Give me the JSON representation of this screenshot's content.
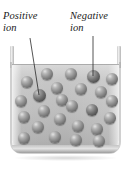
{
  "figure": {
    "background_color": "#ffffff"
  },
  "labels": [
    {
      "id": "positive",
      "text": "Positive\nion",
      "x": 3,
      "y": 10,
      "leader": {
        "x1": 30,
        "y1": 38,
        "x2": 39,
        "y2": 95
      }
    },
    {
      "id": "negative",
      "text": "Negative\nion",
      "x": 70,
      "y": 10,
      "leader": {
        "x1": 93,
        "y1": 36,
        "x2": 93,
        "y2": 76
      }
    }
  ],
  "container": {
    "name": "glass-beaker",
    "glass_color": "#c9c9c9",
    "liquid_color_top": "#d8d8d8",
    "liquid_color_bottom": "#a8a8a8",
    "rim_line_color": "#9a9a9a"
  },
  "ions": {
    "sphere_color_light": "#8e8e8e",
    "sphere_color_dark": "#717171",
    "count": 25,
    "items": [
      {
        "cx": 27,
        "cy": 82,
        "r": 6.0,
        "shade": "light"
      },
      {
        "cx": 47,
        "cy": 74,
        "r": 6.2,
        "shade": "light"
      },
      {
        "cx": 71,
        "cy": 74,
        "r": 6.2,
        "shade": "light"
      },
      {
        "cx": 93,
        "cy": 76,
        "r": 6.5,
        "shade": "dark"
      },
      {
        "cx": 112,
        "cy": 79,
        "r": 6.0,
        "shade": "light"
      },
      {
        "cx": 39,
        "cy": 95,
        "r": 6.5,
        "shade": "dark"
      },
      {
        "cx": 57,
        "cy": 88,
        "r": 5.8,
        "shade": "light"
      },
      {
        "cx": 81,
        "cy": 89,
        "r": 6.2,
        "shade": "light"
      },
      {
        "cx": 101,
        "cy": 92,
        "r": 6.0,
        "shade": "light"
      },
      {
        "cx": 21,
        "cy": 101,
        "r": 6.0,
        "shade": "light"
      },
      {
        "cx": 62,
        "cy": 100,
        "r": 6.0,
        "shade": "light"
      },
      {
        "cx": 112,
        "cy": 101,
        "r": 5.8,
        "shade": "light"
      },
      {
        "cx": 44,
        "cy": 111,
        "r": 6.2,
        "shade": "light"
      },
      {
        "cx": 72,
        "cy": 106,
        "r": 6.0,
        "shade": "light"
      },
      {
        "cx": 92,
        "cy": 110,
        "r": 6.2,
        "shade": "dark"
      },
      {
        "cx": 24,
        "cy": 117,
        "r": 6.0,
        "shade": "light"
      },
      {
        "cx": 60,
        "cy": 119,
        "r": 6.0,
        "shade": "light"
      },
      {
        "cx": 110,
        "cy": 118,
        "r": 5.8,
        "shade": "light"
      },
      {
        "cx": 38,
        "cy": 127,
        "r": 6.0,
        "shade": "light"
      },
      {
        "cx": 78,
        "cy": 126,
        "r": 6.2,
        "shade": "light"
      },
      {
        "cx": 97,
        "cy": 129,
        "r": 5.8,
        "shade": "light"
      },
      {
        "cx": 24,
        "cy": 138,
        "r": 6.2,
        "shade": "light"
      },
      {
        "cx": 55,
        "cy": 137,
        "r": 6.0,
        "shade": "light"
      },
      {
        "cx": 76,
        "cy": 140,
        "r": 6.0,
        "shade": "light"
      },
      {
        "cx": 99,
        "cy": 141,
        "r": 6.0,
        "shade": "light"
      }
    ]
  }
}
